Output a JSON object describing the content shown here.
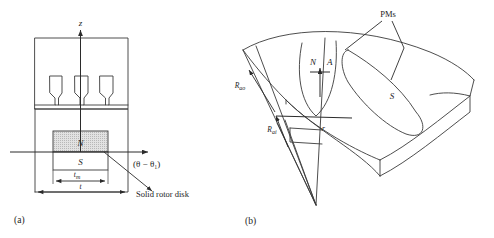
{
  "figure": {
    "background_color": "#ffffff",
    "line_color": "#3a3a3a",
    "magnet_n_fill": "#d3d3d3",
    "magnet_s_fill": "#ffffff"
  },
  "panel_a": {
    "caption": "(a)",
    "axis_z_label": "z",
    "angle_label": "(θ − θ₁)",
    "magnet_north_label": "N",
    "magnet_south_label": "S",
    "dim_magnet_label": "t",
    "dim_magnet_sub": "m",
    "dim_pitch_label": "t",
    "callout_label": "Solid rotor disk",
    "slot_count": 3
  },
  "panel_b": {
    "caption": "(b)",
    "pms_label": "PMs",
    "magnet_north_label": "N",
    "point_label": "A",
    "magnet_south_label": "S",
    "radius_outer_label": "R",
    "radius_outer_sub": "ao",
    "radius_inner_label": "R",
    "radius_inner_sub": "ai",
    "radius_variable_label": "r"
  }
}
